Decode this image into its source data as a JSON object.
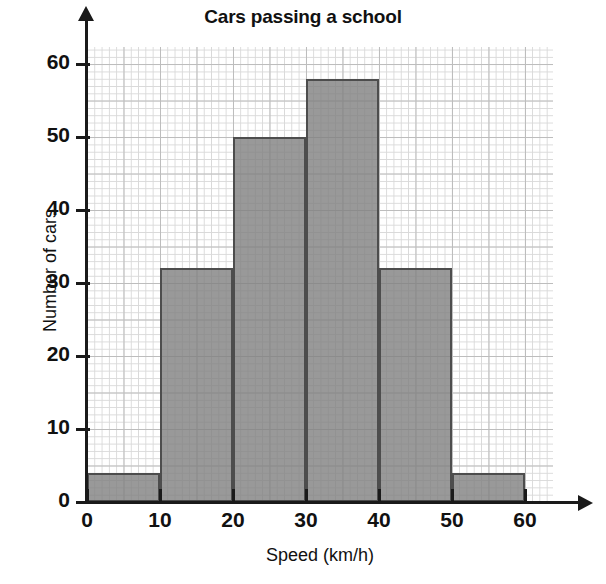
{
  "chart_data": {
    "type": "bar",
    "title": "Cars passing a school",
    "xlabel": "Speed (km/h)",
    "ylabel": "Number of cars",
    "categories": [
      "0-10",
      "10-20",
      "20-30",
      "30-40",
      "40-50",
      "50-60"
    ],
    "bin_edges": [
      0,
      10,
      20,
      30,
      40,
      50,
      60
    ],
    "values": [
      4,
      32,
      50,
      58,
      32,
      4
    ],
    "xlim": [
      0,
      65
    ],
    "ylim": [
      0,
      62
    ],
    "xticks": [
      0,
      10,
      20,
      30,
      40,
      50,
      60
    ],
    "yticks": [
      0,
      10,
      20,
      30,
      40,
      50,
      60
    ],
    "xticklabels": [
      "0",
      "10",
      "20",
      "30",
      "40",
      "50",
      "60"
    ],
    "yticklabels": [
      "0",
      "10",
      "20",
      "30",
      "40",
      "50",
      "60"
    ],
    "grid": true,
    "grid_minor_step": 1,
    "grid_major_step": 5,
    "legend": false,
    "bar_color": "#808080",
    "bar_edge_color": "#4d4d4d",
    "grid_minor_color": "#d9d9d9",
    "grid_major_color": "#bdbdbd",
    "axis_color": "#1a1a1a"
  }
}
